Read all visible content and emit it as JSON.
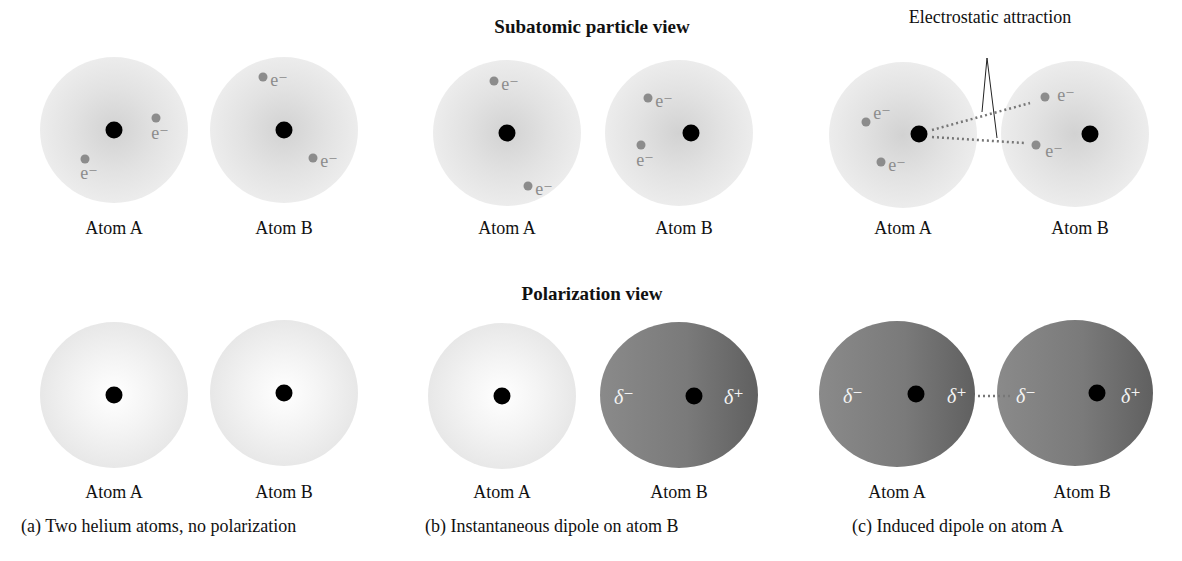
{
  "titles": {
    "subatomic": "Subatomic particle view",
    "polarization": "Polarization view"
  },
  "annotation": "Electrostatic attraction",
  "electron_label": "e⁻",
  "delta_minus": "δ⁻",
  "delta_plus": "δ⁺",
  "panels": [
    {
      "id": "a",
      "caption": "(a) Two helium atoms, no polarization",
      "subatomic": {
        "atom_a_label": "Atom A",
        "atom_b_label": "Atom B"
      },
      "polarization": {
        "atom_a_label": "Atom A",
        "atom_b_label": "Atom B",
        "atom_a_state": "no polarization",
        "atom_b_state": "no polarization"
      }
    },
    {
      "id": "b",
      "caption": "(b) Instantaneous dipole on atom B",
      "subatomic": {
        "atom_a_label": "Atom A",
        "atom_b_label": "Atom B"
      },
      "polarization": {
        "atom_a_label": "Atom A",
        "atom_b_label": "Atom B",
        "atom_a_state": "no polarization",
        "atom_b_state": "dipole"
      }
    },
    {
      "id": "c",
      "caption": "(c) Induced dipole on atom A",
      "subatomic": {
        "atom_a_label": "Atom A",
        "atom_b_label": "Atom B"
      },
      "polarization": {
        "atom_a_label": "Atom A",
        "atom_b_label": "Atom B",
        "atom_a_state": "induced dipole",
        "atom_b_state": "dipole"
      }
    }
  ],
  "colors": {
    "nucleus": "#000000",
    "electron": "#8c8c8c",
    "cloud_light": "#ececec",
    "dipole_fill": "#7a7a7a"
  }
}
